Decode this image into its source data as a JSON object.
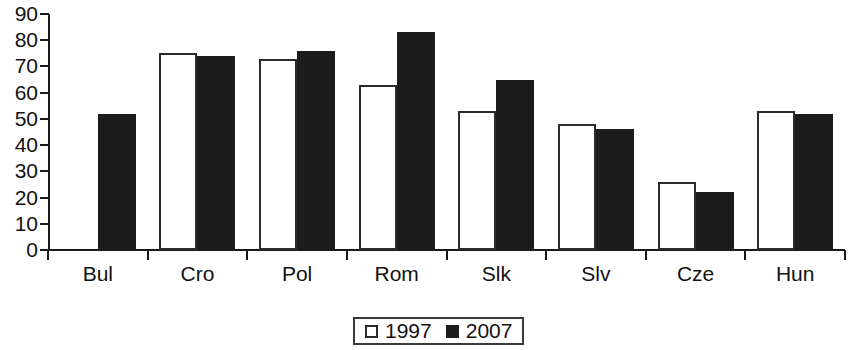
{
  "chart_data": {
    "type": "bar",
    "title": "",
    "subtitle": "",
    "xlabel": "",
    "ylabel": "",
    "ylim": [
      0,
      90
    ],
    "ytick_step": 10,
    "ytick_labels": [
      "90",
      "80",
      "70",
      "60",
      "50",
      "40",
      "30",
      "20",
      "10",
      "0"
    ],
    "grid": false,
    "legend_position": "bottom-center",
    "categories": [
      "Bul",
      "Cro",
      "Pol",
      "Rom",
      "Slk",
      "Slv",
      "Cze",
      "Hun"
    ],
    "series": [
      {
        "name": "1997",
        "color": "#ffffff",
        "style": "open",
        "values": [
          null,
          75,
          73,
          63,
          53,
          48,
          26,
          53
        ]
      },
      {
        "name": "2007",
        "color": "#1c1c1c",
        "style": "filled",
        "values": [
          52,
          74,
          76,
          83,
          65,
          46,
          22,
          52
        ]
      }
    ]
  },
  "legend": {
    "items": [
      {
        "label": "1997",
        "swatch": "open-square-icon"
      },
      {
        "label": "2007",
        "swatch": "filled-square-icon"
      }
    ]
  }
}
